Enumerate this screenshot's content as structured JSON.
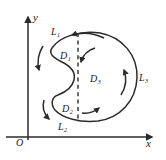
{
  "figure": {
    "background_color": "#ffffff",
    "ink_color": "#2b2b2b",
    "axes": {
      "x_label": "x",
      "y_label": "y",
      "origin_label": "O"
    },
    "regions": [
      {
        "name": "D",
        "subscript": "1"
      },
      {
        "name": "D",
        "subscript": "2"
      },
      {
        "name": "D",
        "subscript": "3"
      }
    ],
    "curves": [
      {
        "name": "L",
        "subscript": "1"
      },
      {
        "name": "L",
        "subscript": "2"
      },
      {
        "name": "L",
        "subscript": "3"
      }
    ]
  }
}
